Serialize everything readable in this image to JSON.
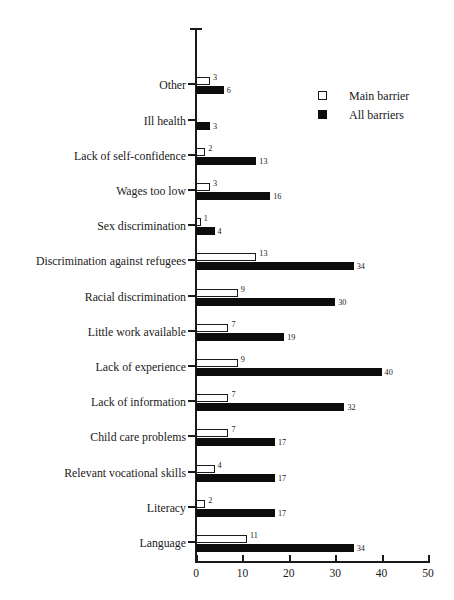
{
  "chart_data": {
    "type": "bar",
    "orientation": "horizontal",
    "title": "",
    "subtitle": "",
    "xlabel": "",
    "ylabel": "",
    "xlim": [
      0,
      50
    ],
    "xticks": [
      0,
      10,
      20,
      30,
      40,
      50
    ],
    "xtick_labels": [
      "0",
      "10",
      "20",
      "30",
      "40",
      "50"
    ],
    "grid": false,
    "legend_position": "top-right",
    "categories": [
      "Language",
      "Literacy",
      "Relevant vocational skills",
      "Child care problems",
      "Lack of information",
      "Lack of experience",
      "Little work available",
      "Racial discrimination",
      "Discrimination against refugees",
      "Sex discrimination",
      "Wages too low",
      "Lack of self-confidence",
      "Ill health",
      "Other"
    ],
    "series": [
      {
        "name": "Main barrier",
        "color": "#ffffff",
        "edge_color": "#1a1a1a",
        "values": [
          11,
          2,
          4,
          7,
          7,
          9,
          7,
          9,
          13,
          1,
          3,
          2,
          null,
          3
        ],
        "value_labels": [
          "11",
          "2",
          "4",
          "7",
          "7",
          "9",
          "7",
          "9",
          "13",
          "1",
          "3",
          "2",
          "",
          "3"
        ]
      },
      {
        "name": "All barriers",
        "color": "#0d0d0d",
        "edge_color": "#0d0d0d",
        "values": [
          34,
          17,
          17,
          17,
          32,
          40,
          19,
          30,
          34,
          4,
          16,
          13,
          3,
          6
        ],
        "value_labels": [
          "34",
          "17",
          "17",
          "17",
          "32",
          "40",
          "19",
          "30",
          "34",
          "4",
          "16",
          "13",
          "3",
          "6"
        ]
      }
    ]
  },
  "legend": {
    "items": [
      {
        "label": "Main barrier",
        "swatch": "hollow-square-swatch"
      },
      {
        "label": "All barriers",
        "swatch": "filled-square-swatch"
      }
    ]
  }
}
